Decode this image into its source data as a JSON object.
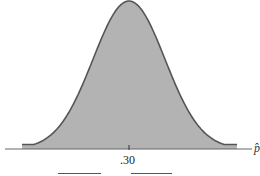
{
  "chart_data": {
    "type": "area",
    "title": "",
    "xlabel": "p̂",
    "ylabel": "",
    "center": 0.3,
    "tick_labels": [
      ".30"
    ],
    "shaded": "entire area under curve",
    "grid": false,
    "legend": null,
    "blanks": [
      "",
      ""
    ],
    "colors": {
      "fill": "#b3b3b3",
      "curve": "#555555",
      "axis": "#666666"
    }
  },
  "labels": {
    "center_tick": ".30",
    "axis_variable": "p̂"
  }
}
